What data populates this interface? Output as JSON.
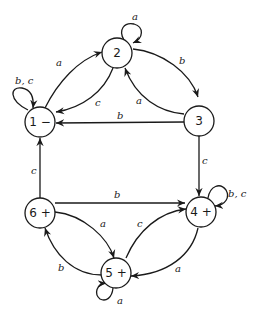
{
  "diagram": {
    "type": "finite-state-automaton",
    "nodes": [
      {
        "id": "1",
        "label": "1 −",
        "role": "negative"
      },
      {
        "id": "2",
        "label": "2"
      },
      {
        "id": "3",
        "label": "3"
      },
      {
        "id": "4",
        "label": "4 +",
        "role": "positive"
      },
      {
        "id": "5",
        "label": "5 +",
        "role": "positive"
      },
      {
        "id": "6",
        "label": "6 +",
        "role": "positive"
      }
    ],
    "edges": [
      {
        "from": "1",
        "to": "1",
        "label": "b, c"
      },
      {
        "from": "1",
        "to": "2",
        "label": "a"
      },
      {
        "from": "2",
        "to": "2",
        "label": "a"
      },
      {
        "from": "2",
        "to": "1",
        "label": "c"
      },
      {
        "from": "2",
        "to": "3",
        "label": "b"
      },
      {
        "from": "3",
        "to": "2",
        "label": "a"
      },
      {
        "from": "3",
        "to": "1",
        "label": "b"
      },
      {
        "from": "3",
        "to": "4",
        "label": "c"
      },
      {
        "from": "6",
        "to": "1",
        "label": "c"
      },
      {
        "from": "6",
        "to": "4",
        "label": "b"
      },
      {
        "from": "6",
        "to": "5",
        "label": "a"
      },
      {
        "from": "5",
        "to": "6",
        "label": "b"
      },
      {
        "from": "5",
        "to": "4",
        "label": "c"
      },
      {
        "from": "4",
        "to": "5",
        "label": "a"
      },
      {
        "from": "4",
        "to": "4",
        "label": "b, c"
      },
      {
        "from": "5",
        "to": "5",
        "label": "a"
      }
    ]
  }
}
